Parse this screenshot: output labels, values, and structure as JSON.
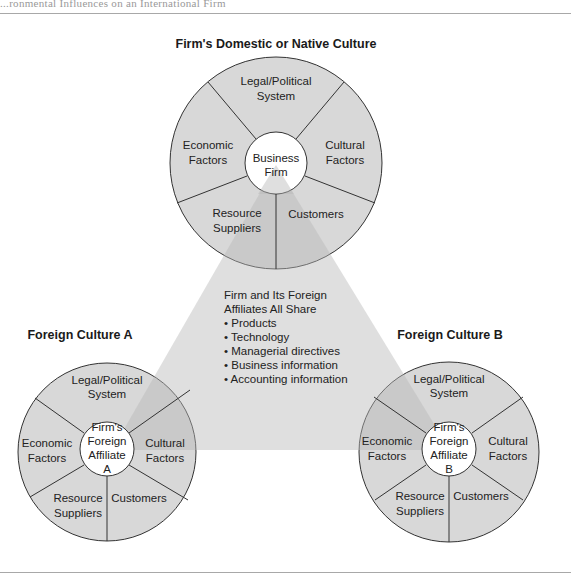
{
  "figure": {
    "cut_title": "...ronmental Influences on an International Firm",
    "colors": {
      "ring_fill": "#d8d8d8",
      "triangle_fill": "#c8c8c8",
      "inner_fill": "#ffffff",
      "stroke": "#333333",
      "rule": "#a8a8a8"
    }
  },
  "domestic": {
    "title": "Firm's Domestic or Native Culture",
    "center_lines": [
      "Business",
      "Firm"
    ],
    "segments": {
      "legal": [
        "Legal/Political",
        "System"
      ],
      "economic": [
        "Economic",
        "Factors"
      ],
      "cultural": [
        "Cultural",
        "Factors"
      ],
      "resource": [
        "Resource",
        "Suppliers"
      ],
      "customers": [
        "Customers"
      ]
    }
  },
  "foreign_a": {
    "title": "Foreign Culture A",
    "center_lines": [
      "Firm's",
      "Foreign",
      "Affiliate",
      "A"
    ],
    "segments": {
      "legal": [
        "Legal/Political",
        "System"
      ],
      "economic": [
        "Economic",
        "Factors"
      ],
      "cultural": [
        "Cultural",
        "Factors"
      ],
      "resource": [
        "Resource",
        "Suppliers"
      ],
      "customers": [
        "Customers"
      ]
    }
  },
  "foreign_b": {
    "title": "Foreign Culture B",
    "center_lines": [
      "Firm's",
      "Foreign",
      "Affiliate",
      "B"
    ],
    "segments": {
      "legal": [
        "Legal/Political",
        "System"
      ],
      "economic": [
        "Economic",
        "Factors"
      ],
      "cultural": [
        "Cultural",
        "Factors"
      ],
      "resource": [
        "Resource",
        "Suppliers"
      ],
      "customers": [
        "Customers"
      ]
    }
  },
  "shared": {
    "heading": [
      "Firm and Its Foreign",
      "Affiliates All Share"
    ],
    "items": [
      "• Products",
      "• Technology",
      "• Managerial directives",
      "• Business information",
      "• Accounting information"
    ]
  }
}
